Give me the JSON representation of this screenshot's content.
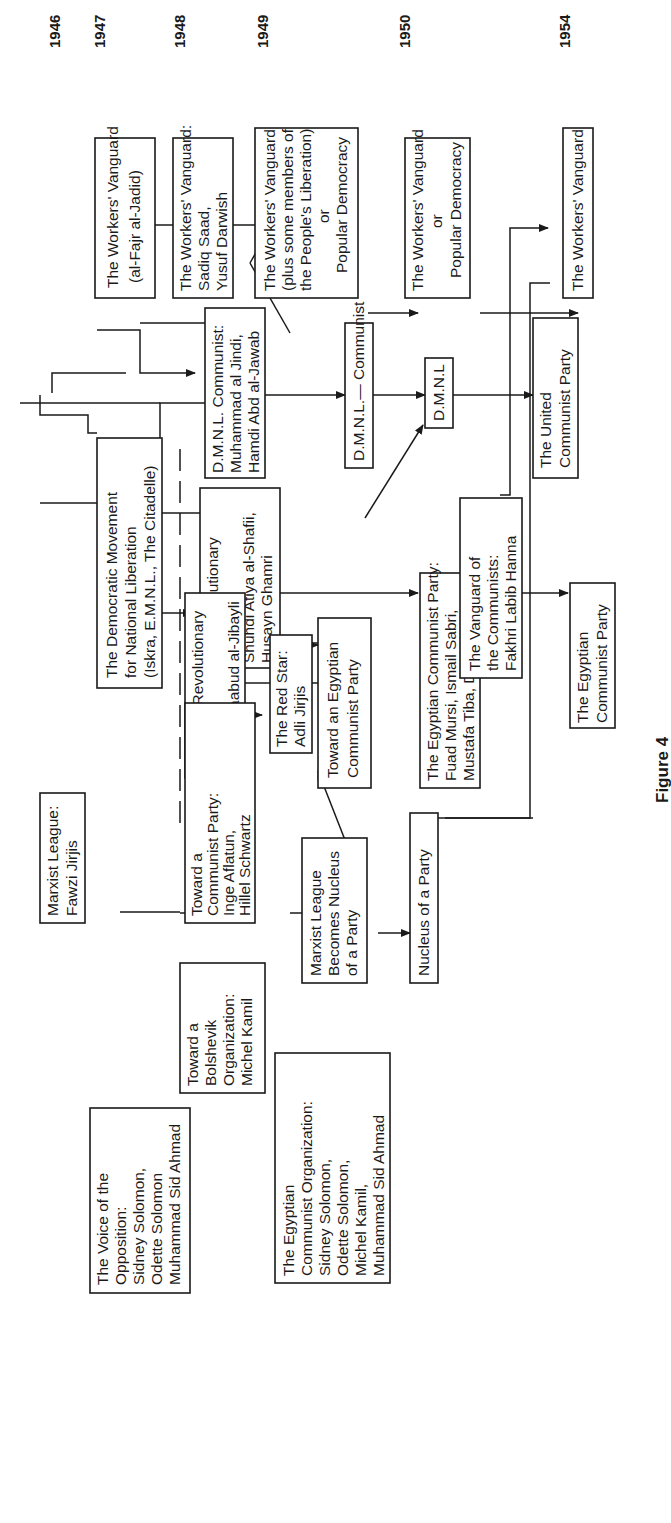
{
  "figure": {
    "caption": "Figure 4",
    "orientation": "rotated 90° counter-clockwise (landscape page)"
  },
  "years": [
    "1946",
    "1947",
    "1948",
    "1949",
    "1950",
    "1954"
  ],
  "nodes": {
    "wv_1947": {
      "lines": [
        "The Workers' Vanguard",
        "(al-Fajr  al-Jadid)"
      ]
    },
    "wv_1948": {
      "lines": [
        "The Workers' Vanguard:",
        "Sadiq Saad,",
        "Yusuf Darwish"
      ]
    },
    "wv_1949": {
      "lines": [
        "The Workers' Vanguard",
        "(plus some members of",
        "the People's Liberation)",
        "or",
        "Popular Democracy"
      ]
    },
    "wv_1950": {
      "lines": [
        "The Workers' Vanguard",
        "or",
        "Popular Democracy"
      ]
    },
    "wv_1954": {
      "lines": [
        "The Workers' Vanguard"
      ]
    },
    "dmnl_communist": {
      "lines": [
        "D.M.N.L. Communist:",
        "Muhammad al Jindi,",
        "Hamdi Abd al-Jawab"
      ]
    },
    "dmnl_communist_2": {
      "lines": [
        "D.M.N.L.— Communist"
      ]
    },
    "dmnl_small": {
      "lines": [
        "D.M.N.L"
      ]
    },
    "united_cp": {
      "lines": [
        "The United",
        "Communist  Party"
      ]
    },
    "rev_faction": {
      "lines": [
        "The Revolutionary",
        "Faction:",
        "Shuhdi   Atiya  al-Shafii,",
        "Husayn Ghamri"
      ]
    },
    "ecp_fuad": {
      "lines": [
        "The Egyptian Communist Party:",
        "Fuad Mursi, Ismail Sabri,",
        "Mustafa Tiba, Daud Aziz"
      ]
    },
    "ecp": {
      "lines": [
        "The Egyptian",
        "Communist Party"
      ]
    },
    "dmnl_main": {
      "lines": [
        "The Democratic Movement",
        "for National Liberation",
        "(Iskra, E.M.N.L., The Citadelle)"
      ]
    },
    "dmnl_rev_workers": {
      "lines": [
        "D.M.N.L. Revolutionary",
        "Workers:",
        "Abd al-Maabud al-Jibayli"
      ]
    },
    "red_star": {
      "lines": [
        "The Red Star:",
        "Adli  Jirjis"
      ]
    },
    "toward_ecp": {
      "lines": [
        "Toward an Egyptian",
        "Communist Party"
      ]
    },
    "vanguard_communists": {
      "lines": [
        "The Vanguard of",
        "the Communists:",
        "Fakhri Labib Hanna"
      ]
    },
    "marxist_league": {
      "lines": [
        "Marxist League:",
        "Fawzi  Jirjis"
      ]
    },
    "toward_cp": {
      "lines": [
        "Toward a",
        "Communist Party:",
        "Inge  Aflatun,",
        "Hillel  Schwartz"
      ]
    },
    "ml_nucleus": {
      "lines": [
        "Marxist League",
        "Becomes Nucleus",
        "of a Party"
      ]
    },
    "nucleus": {
      "lines": [
        "Nucleus of a Party"
      ]
    },
    "bolshevik": {
      "lines": [
        "Toward a",
        "Bolshevik",
        "Organization:",
        "Michel Kamil"
      ]
    },
    "voice_opposition": {
      "lines": [
        "The Voice of the",
        "Opposition:",
        "Sidney Solomon,",
        "Odette Solomon",
        "Muhammad Sid Ahmad"
      ]
    },
    "eco": {
      "lines": [
        "The Egyptian",
        "Communist Organization:",
        "Sidney Solomon,",
        "Odette Solomon,",
        "Michel Kamil,",
        "Muhammad Sid Ahmad"
      ]
    }
  },
  "edges": [
    [
      "wv_1947",
      "wv_1948"
    ],
    [
      "wv_1948",
      "wv_1949"
    ],
    [
      "wv_1949",
      "wv_1950"
    ],
    [
      "wv_1950",
      "wv_1954"
    ],
    [
      "dmnl_main",
      "dmnl_communist"
    ],
    [
      "dmnl_communist",
      "dmnl_communist_2"
    ],
    [
      "dmnl_communist_2",
      "dmnl_small"
    ],
    [
      "dmnl_small",
      "united_cp"
    ],
    [
      "dmnl_main",
      "rev_faction"
    ],
    [
      "rev_faction",
      "ecp_fuad"
    ],
    [
      "ecp_fuad",
      "ecp"
    ],
    [
      "dmnl_main",
      "dmnl_rev_workers"
    ],
    [
      "dmnl_rev_workers",
      "red_star"
    ],
    [
      "dmnl_rev_workers",
      "toward_ecp"
    ],
    [
      "toward_ecp",
      "dmnl_small"
    ],
    [
      "dmnl_main",
      "toward_cp"
    ],
    [
      "dmnl_main",
      "bolshevik"
    ],
    [
      "dmnl_main",
      "voice_opposition"
    ],
    [
      "marxist_league",
      "toward_cp"
    ],
    [
      "toward_cp",
      "ml_nucleus"
    ],
    [
      "toward_cp",
      "toward_ecp"
    ],
    [
      "ml_nucleus",
      "nucleus"
    ],
    [
      "nucleus",
      "united_cp"
    ],
    [
      "vanguard_communists",
      "united_cp"
    ],
    [
      "bolshevik",
      "eco"
    ],
    [
      "voice_opposition",
      "eco"
    ]
  ]
}
